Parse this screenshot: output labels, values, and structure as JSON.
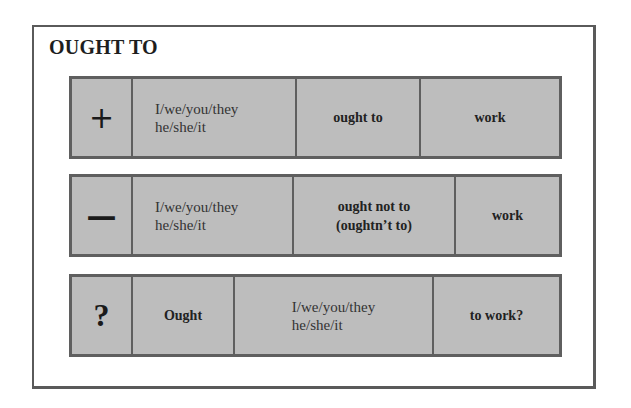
{
  "title": "OUGHT TO",
  "rows": [
    {
      "type": "positive",
      "symbol": "+",
      "cells": [
        "I/we/you/they",
        "he/she/it",
        "ought to",
        "work"
      ]
    },
    {
      "type": "negative",
      "symbol": "—",
      "pronoun_line1": "I/we/you/they",
      "pronoun_line2": "he/she/it",
      "verb_line1": "ought not to",
      "verb_line2": "(oughtn’t to)",
      "main": "work"
    },
    {
      "type": "question",
      "symbol": "?",
      "aux": "Ought",
      "pronoun_line1": "I/we/you/they",
      "pronoun_line2": "he/she/it",
      "main": "to work?"
    }
  ],
  "colors": {
    "cell_fill": "#bdbdbd",
    "border": "#5f5f5f",
    "frame_border": "#5a5a5a",
    "background": "#ffffff"
  }
}
